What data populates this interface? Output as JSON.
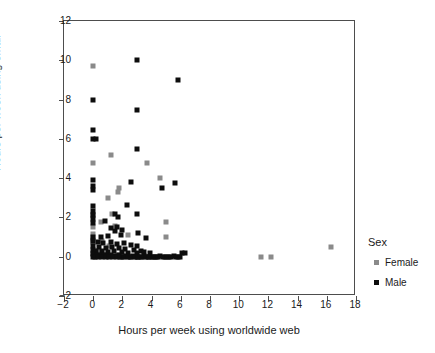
{
  "chart_data": {
    "type": "scatter",
    "title": "",
    "xlabel": "Hours per week using worldwide web",
    "ylabel": "Hours per week using email",
    "xlim": [
      -2,
      18
    ],
    "ylim": [
      -2,
      12
    ],
    "xticks": [
      -2,
      0,
      2,
      4,
      6,
      8,
      10,
      12,
      14,
      16,
      18
    ],
    "yticks": [
      -2,
      0,
      2,
      4,
      6,
      8,
      10,
      12
    ],
    "grid": false,
    "legend": {
      "title": "Sex",
      "position": "right",
      "entries": [
        {
          "name": "Female",
          "color": "#8a8a8a",
          "marker": "square"
        },
        {
          "name": "Male",
          "color": "#0d0d0d",
          "marker": "square"
        }
      ]
    },
    "series": [
      {
        "name": "Female",
        "color": "#8a8a8a",
        "points": [
          [
            0.0,
            9.7
          ],
          [
            0.0,
            4.75
          ],
          [
            1.2,
            5.2
          ],
          [
            3.7,
            4.75
          ],
          [
            4.6,
            4.0
          ],
          [
            1.0,
            3.0
          ],
          [
            1.7,
            3.3
          ],
          [
            1.75,
            3.5
          ],
          [
            0.0,
            2.1
          ],
          [
            1.3,
            2.2
          ],
          [
            0.5,
            1.75
          ],
          [
            0.0,
            1.5
          ],
          [
            1.5,
            1.55
          ],
          [
            5.0,
            1.75
          ],
          [
            0.0,
            1.15
          ],
          [
            2.4,
            1.1
          ],
          [
            5.0,
            1.0
          ],
          [
            0.0,
            0.9
          ],
          [
            0.0,
            0.75
          ],
          [
            0.6,
            0.8
          ],
          [
            1.1,
            0.55
          ],
          [
            0.3,
            0.3
          ],
          [
            0.0,
            0.2
          ],
          [
            0.9,
            0.15
          ],
          [
            1.6,
            0.1
          ],
          [
            2.0,
            0.05
          ],
          [
            3.1,
            0.0
          ],
          [
            4.1,
            0.0
          ],
          [
            4.4,
            0.0
          ],
          [
            11.5,
            0.0
          ],
          [
            12.2,
            0.0
          ],
          [
            16.3,
            0.5
          ]
        ]
      },
      {
        "name": "Male",
        "color": "#0d0d0d",
        "points": [
          [
            3.0,
            10.0
          ],
          [
            5.8,
            9.0
          ],
          [
            0.0,
            8.0
          ],
          [
            3.0,
            7.45
          ],
          [
            0.0,
            6.45
          ],
          [
            0.0,
            6.0
          ],
          [
            0.2,
            6.0
          ],
          [
            3.0,
            5.5
          ],
          [
            0.0,
            3.9
          ],
          [
            0.0,
            3.6
          ],
          [
            0.0,
            3.4
          ],
          [
            2.6,
            3.8
          ],
          [
            4.7,
            3.5
          ],
          [
            5.6,
            3.75
          ],
          [
            0.0,
            2.6
          ],
          [
            0.0,
            2.35
          ],
          [
            0.0,
            2.1
          ],
          [
            2.3,
            2.65
          ],
          [
            1.5,
            2.2
          ],
          [
            1.7,
            2.0
          ],
          [
            3.0,
            2.2
          ],
          [
            0.0,
            1.9
          ],
          [
            0.0,
            1.7
          ],
          [
            0.8,
            1.8
          ],
          [
            1.2,
            1.45
          ],
          [
            1.6,
            1.5
          ],
          [
            1.5,
            1.3
          ],
          [
            2.0,
            1.35
          ],
          [
            3.1,
            1.2
          ],
          [
            0.0,
            1.0
          ],
          [
            0.5,
            1.0
          ],
          [
            1.0,
            1.05
          ],
          [
            1.9,
            1.1
          ],
          [
            3.6,
            0.95
          ],
          [
            0.0,
            0.8
          ],
          [
            0.3,
            0.75
          ],
          [
            0.7,
            0.7
          ],
          [
            1.2,
            0.75
          ],
          [
            1.6,
            0.65
          ],
          [
            2.1,
            0.7
          ],
          [
            2.6,
            0.6
          ],
          [
            3.0,
            0.55
          ],
          [
            0.0,
            0.55
          ],
          [
            0.4,
            0.5
          ],
          [
            0.9,
            0.45
          ],
          [
            1.3,
            0.5
          ],
          [
            1.8,
            0.45
          ],
          [
            2.2,
            0.4
          ],
          [
            2.8,
            0.35
          ],
          [
            3.3,
            0.3
          ],
          [
            0.0,
            0.35
          ],
          [
            0.2,
            0.3
          ],
          [
            0.6,
            0.3
          ],
          [
            1.0,
            0.25
          ],
          [
            1.4,
            0.3
          ],
          [
            2.0,
            0.25
          ],
          [
            2.4,
            0.2
          ],
          [
            3.0,
            0.2
          ],
          [
            3.5,
            0.25
          ],
          [
            3.9,
            0.2
          ],
          [
            0.0,
            0.15
          ],
          [
            0.25,
            0.1
          ],
          [
            0.5,
            0.1
          ],
          [
            0.75,
            0.1
          ],
          [
            1.0,
            0.05
          ],
          [
            1.25,
            0.1
          ],
          [
            1.5,
            0.05
          ],
          [
            1.75,
            0.1
          ],
          [
            2.0,
            0.0
          ],
          [
            2.25,
            0.05
          ],
          [
            2.5,
            0.0
          ],
          [
            2.75,
            0.05
          ],
          [
            3.0,
            0.0
          ],
          [
            3.25,
            0.0
          ],
          [
            3.5,
            0.05
          ],
          [
            3.75,
            0.0
          ],
          [
            4.0,
            0.0
          ],
          [
            4.3,
            0.0
          ],
          [
            4.6,
            0.05
          ],
          [
            4.9,
            0.0
          ],
          [
            5.2,
            0.0
          ],
          [
            5.5,
            0.05
          ],
          [
            5.8,
            0.0
          ],
          [
            6.1,
            0.2
          ],
          [
            6.3,
            0.2
          ],
          [
            0.0,
            0.0
          ],
          [
            0.15,
            0.0
          ],
          [
            0.35,
            0.0
          ],
          [
            0.6,
            0.0
          ],
          [
            0.85,
            0.0
          ],
          [
            1.1,
            0.0
          ],
          [
            1.35,
            0.0
          ],
          [
            1.6,
            0.0
          ],
          [
            1.85,
            0.0
          ],
          [
            2.1,
            0.0
          ],
          [
            2.35,
            0.0
          ],
          [
            2.6,
            0.0
          ],
          [
            2.85,
            0.0
          ],
          [
            3.1,
            0.0
          ],
          [
            3.35,
            0.0
          ],
          [
            3.6,
            0.0
          ],
          [
            3.85,
            0.0
          ],
          [
            4.15,
            0.0
          ],
          [
            4.45,
            0.0
          ],
          [
            4.75,
            0.0
          ],
          [
            5.05,
            0.0
          ],
          [
            5.35,
            0.0
          ],
          [
            5.65,
            0.0
          ],
          [
            5.95,
            0.0
          ]
        ]
      }
    ]
  }
}
